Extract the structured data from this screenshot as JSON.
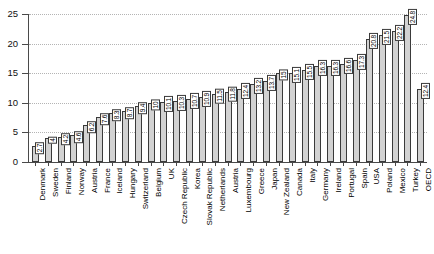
{
  "chart_data": {
    "type": "bar",
    "title": "",
    "subtitle": "",
    "xlabel": "",
    "ylabel": "",
    "ylim": [
      0,
      25
    ],
    "yticks": [
      0,
      5,
      10,
      15,
      20,
      25
    ],
    "grid": true,
    "legend": false,
    "orientation": "vertical",
    "categories": [
      "Denmark",
      "Sweden",
      "Finland",
      "Norway",
      "Austria",
      "France",
      "Iceland",
      "Hungary",
      "Switzerland",
      "Belgium",
      "UK",
      "Czech Republic",
      "Korea",
      "Slovak Republic",
      "Netherlands",
      "Austria",
      "Luxembourg",
      "Greece",
      "Japan",
      "New Zealand",
      "Canada",
      "Italy",
      "Germany",
      "Ireland",
      "Portugal",
      "Spain",
      "USA",
      "Poland",
      "Mexico",
      "Turkey",
      "OECD"
    ],
    "values": [
      2.7,
      4,
      4.2,
      4.6,
      6.2,
      7.6,
      8.3,
      8.7,
      9.4,
      10,
      10.1,
      10.3,
      10.7,
      10.9,
      11.5,
      11.8,
      12.4,
      13.2,
      13.7,
      15,
      15.1,
      15.5,
      16.3,
      16.3,
      16.6,
      17.3,
      20.8,
      21.5,
      22.2,
      24.8,
      12.4
    ],
    "value_labels": [
      "2.7",
      "4",
      "4.2",
      "4.6",
      "6.2",
      "7.6",
      "8.3",
      "8.7",
      "9.4",
      "10",
      "10.1",
      "10.3",
      "10.7",
      "10.9",
      "11.5",
      "11.8",
      "12.4",
      "13.2",
      "13.7",
      "15",
      "15.1",
      "15.5",
      "16.3",
      "16.3",
      "16.6",
      "17.3",
      "20.8",
      "21.5",
      "22.2",
      "24.8",
      "12.4"
    ],
    "colors": {
      "bar_fill": "#d2d2d2",
      "bar_stroke": "#3a3a3a",
      "axis": "#4a4a4a",
      "gridline": "#b4b4b4",
      "label_text": "#000000",
      "label_box": "#ffffff"
    }
  }
}
